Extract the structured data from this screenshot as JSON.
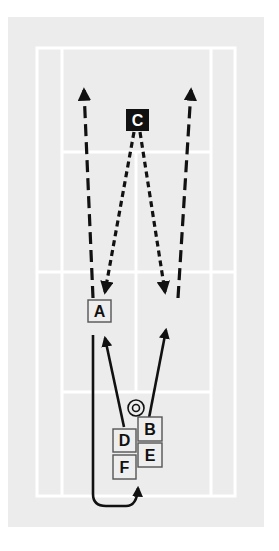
{
  "colors": {
    "page_bg": "#ffffff",
    "field_bg": "#ececec",
    "court_lines": "#ffffff",
    "ink": "#111111",
    "box_fill": "#eeeeee",
    "box_border": "#555555",
    "coach_fill": "#111111",
    "coach_text": "#ffffff"
  },
  "court": {
    "outer": {
      "x": 37,
      "y": 48,
      "w": 198,
      "h": 448
    },
    "inner_left_x": 62,
    "inner_right_x": 211,
    "net_y": 272,
    "service_top_y": 152,
    "service_bottom_y": 392,
    "center_x": 136
  },
  "players": [
    {
      "id": "C",
      "label": "C",
      "role": "coach",
      "x": 126,
      "y": 109,
      "w": 23,
      "h": 22
    },
    {
      "id": "A",
      "label": "A",
      "role": "player",
      "x": 88,
      "y": 300,
      "w": 23,
      "h": 22
    },
    {
      "id": "B",
      "label": "B",
      "role": "player",
      "x": 138,
      "y": 417,
      "w": 24,
      "h": 24
    },
    {
      "id": "D",
      "label": "D",
      "role": "player",
      "x": 113,
      "y": 429,
      "w": 23,
      "h": 23
    },
    {
      "id": "E",
      "label": "E",
      "role": "player",
      "x": 138,
      "y": 443,
      "w": 24,
      "h": 24
    },
    {
      "id": "F",
      "label": "F",
      "role": "player",
      "x": 113,
      "y": 455,
      "w": 23,
      "h": 24
    }
  ],
  "target": {
    "label": "target-circle",
    "cx": 136,
    "cy": 408,
    "r_outer": 8,
    "r_inner": 3.5
  },
  "paths": [
    {
      "name": "dashed-run-left",
      "style": "dashed",
      "d": "M93 298 L84 90"
    },
    {
      "name": "dashed-run-right",
      "style": "dashed",
      "d": "M178 298 L191 90"
    },
    {
      "name": "dotted-feed-left",
      "style": "dotted",
      "d": "M134 132 L106 290"
    },
    {
      "name": "dotted-feed-right",
      "style": "dotted",
      "d": "M140 132 L165 290"
    },
    {
      "name": "solid-pass-left",
      "style": "solid",
      "d": "M124 427 L105 340"
    },
    {
      "name": "solid-pass-right",
      "style": "solid",
      "d": "M149 418 L166 332"
    },
    {
      "name": "solid-loop-return",
      "style": "solid",
      "d": "M93 335 L93 494 Q93 506 106 506 L126 506 Q137 506 138 490"
    }
  ],
  "arrowheads": [
    {
      "name": "arrow-up-left",
      "at": [
        84,
        86
      ],
      "dir": "up"
    },
    {
      "name": "arrow-up-right",
      "at": [
        191,
        86
      ],
      "dir": "up"
    },
    {
      "name": "arrow-down-left",
      "at": [
        104,
        297
      ],
      "dir": "down"
    },
    {
      "name": "arrow-down-right",
      "at": [
        166,
        297
      ],
      "dir": "down"
    },
    {
      "name": "arrow-solid-left",
      "at": [
        103,
        332
      ],
      "dir": "up"
    },
    {
      "name": "arrow-solid-right",
      "at": [
        168,
        324
      ],
      "dir": "up"
    },
    {
      "name": "arrow-loop",
      "at": [
        139,
        482
      ],
      "dir": "up"
    }
  ]
}
